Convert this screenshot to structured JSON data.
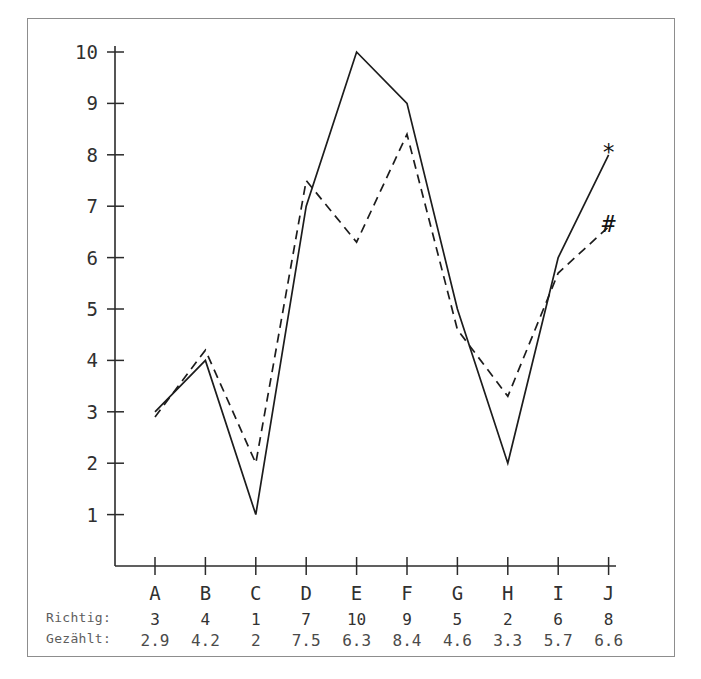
{
  "chart_data": {
    "type": "line",
    "title": "",
    "xlabel": "",
    "ylabel": "",
    "categories": [
      "A",
      "B",
      "C",
      "D",
      "E",
      "F",
      "G",
      "H",
      "I",
      "J"
    ],
    "ylim": [
      0,
      10
    ],
    "ytick_labels": [
      "1",
      "2",
      "3",
      "4",
      "5",
      "6",
      "7",
      "8",
      "9",
      "10"
    ],
    "yticks": [
      1,
      2,
      3,
      4,
      5,
      6,
      7,
      8,
      9,
      10
    ],
    "grid": false,
    "legend_position": "inline-end-markers",
    "series": [
      {
        "name": "Richtig",
        "label": "Richtig:",
        "marker": "*",
        "marker_name": "asterisk-marker",
        "style": "solid",
        "color": "#1c1c1c",
        "values": [
          3,
          4,
          1,
          7,
          10,
          9,
          5,
          2,
          6,
          8
        ]
      },
      {
        "name": "Gezählt",
        "label": "Gezählt:",
        "marker": "#",
        "marker_name": "hash-marker",
        "style": "dashed",
        "color": "#1c1c1c",
        "values": [
          2.9,
          4.2,
          2,
          7.5,
          6.3,
          8.4,
          4.6,
          3.3,
          5.7,
          6.6
        ]
      }
    ]
  },
  "table": {
    "rows": [
      {
        "label": "Richtig:",
        "cells": [
          "3",
          "4",
          "1",
          "7",
          "10",
          "9",
          "5",
          "2",
          "6",
          "8"
        ]
      },
      {
        "label": "Gezählt:",
        "cells": [
          "2.9",
          "4.2",
          "2",
          "7.5",
          "6.3",
          "8.4",
          "4.6",
          "3.3",
          "5.7",
          "6.6"
        ]
      }
    ]
  }
}
